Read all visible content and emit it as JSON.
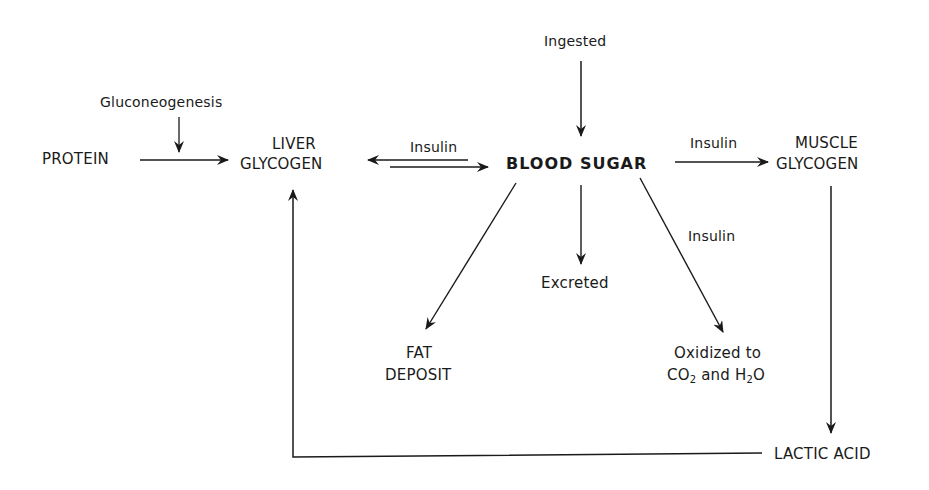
{
  "diagram": {
    "nodes": {
      "protein": "PROTEIN",
      "liver_line1": "LIVER",
      "liver_line2": "GLYCOGEN",
      "blood_sugar": "BLOOD SUGAR",
      "muscle_line1": "MUSCLE",
      "muscle_line2": "GLYCOGEN",
      "fat_line1": "FAT",
      "fat_line2": "DEPOSIT",
      "excreted": "Excreted",
      "oxidized_line1": "Oxidized to",
      "oxidized_co2": "CO",
      "oxidized_sub2a": "2",
      "oxidized_and": " and H",
      "oxidized_sub2b": "2",
      "oxidized_o": "O",
      "lactic_acid": "LACTIC ACID",
      "ingested": "Ingested",
      "gluconeogenesis": "Gluconeogenesis"
    },
    "edge_labels": {
      "liver_blood": "Insulin",
      "blood_muscle": "Insulin",
      "blood_oxidized": "Insulin"
    },
    "colors": {
      "line": "#1a1a1a",
      "background": "#ffffff"
    }
  }
}
